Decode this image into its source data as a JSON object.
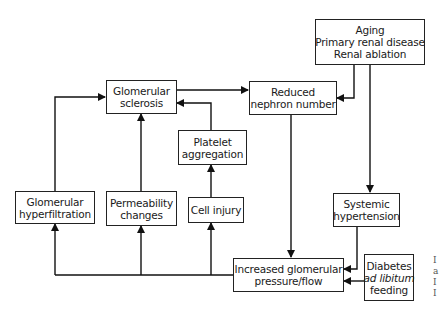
{
  "diagram": {
    "nodes": {
      "causes": {
        "lines": [
          "Aging",
          "Primary renal disease",
          "Renal ablation"
        ]
      },
      "reduced_nephron": {
        "lines": [
          "Reduced",
          "nephron number"
        ]
      },
      "glomerular_sclerosis": {
        "lines": [
          "Glomerular",
          "sclerosis"
        ]
      },
      "platelet_aggregation": {
        "lines": [
          "Platelet",
          "aggregation"
        ]
      },
      "glomerular_hyperfiltration": {
        "lines": [
          "Glomerular",
          "hyperfiltration"
        ]
      },
      "permeability_changes": {
        "lines": [
          "Permeability",
          "changes"
        ]
      },
      "cell_injury": {
        "lines": [
          "Cell injury"
        ]
      },
      "systemic_hypertension": {
        "lines": [
          "Systemic",
          "hypertension"
        ]
      },
      "increased_pressure": {
        "lines": [
          "Increased glomerular",
          "pressure/flow"
        ]
      },
      "diabetes": {
        "lines": [
          "Diabetes",
          "ad libitum",
          "feeding"
        ]
      }
    },
    "edges": [
      {
        "from": "Aging / Primary renal disease / Renal ablation",
        "to": "Reduced nephron number"
      },
      {
        "from": "Aging / Primary renal disease / Renal ablation",
        "to": "Systemic hypertension"
      },
      {
        "from": "Glomerular sclerosis",
        "to": "Reduced nephron number"
      },
      {
        "from": "Reduced nephron number",
        "to": "Increased glomerular pressure/flow"
      },
      {
        "from": "Systemic hypertension",
        "to": "Increased glomerular pressure/flow"
      },
      {
        "from": "Diabetes ad libitum feeding",
        "to": "Increased glomerular pressure/flow"
      },
      {
        "from": "Increased glomerular pressure/flow",
        "to": "Glomerular hyperfiltration"
      },
      {
        "from": "Increased glomerular pressure/flow",
        "to": "Permeability changes"
      },
      {
        "from": "Increased glomerular pressure/flow",
        "to": "Cell injury"
      },
      {
        "from": "Glomerular hyperfiltration",
        "to": "Glomerular sclerosis"
      },
      {
        "from": "Permeability changes",
        "to": "Glomerular sclerosis"
      },
      {
        "from": "Cell injury",
        "to": "Platelet aggregation"
      },
      {
        "from": "Platelet aggregation",
        "to": "Glomerular sclerosis"
      }
    ],
    "edge_fragments": [
      "I",
      "a",
      "I",
      "I"
    ]
  }
}
